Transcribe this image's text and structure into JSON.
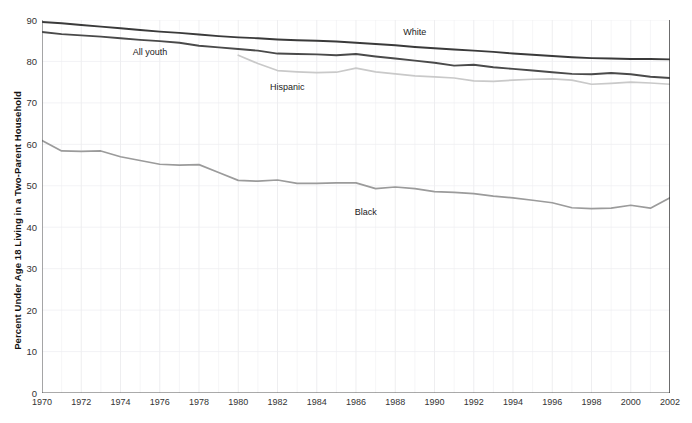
{
  "chart_data": {
    "type": "line",
    "title": "",
    "xlabel": "",
    "ylabel": "Percent Under Age 18 Living in a Two-Parent Household",
    "xlim": [
      1970,
      2002
    ],
    "ylim": [
      0,
      90
    ],
    "ytick_step": 10,
    "yticks": [
      0,
      10,
      20,
      30,
      40,
      50,
      60,
      70,
      80,
      90
    ],
    "xticks": [
      1970,
      1972,
      1974,
      1976,
      1978,
      1980,
      1982,
      1984,
      1986,
      1988,
      1990,
      1992,
      1994,
      1996,
      1998,
      2000,
      2002
    ],
    "grid": true,
    "grid_minor_x": "every year",
    "legend_position": "inline-annotations",
    "x": [
      1970,
      1971,
      1972,
      1973,
      1974,
      1975,
      1976,
      1977,
      1978,
      1979,
      1980,
      1981,
      1982,
      1983,
      1984,
      1985,
      1986,
      1987,
      1988,
      1989,
      1990,
      1991,
      1992,
      1993,
      1994,
      1995,
      1996,
      1997,
      1998,
      1999,
      2000,
      2001,
      2002
    ],
    "series": [
      {
        "name": "White",
        "color": "#3a3a3a",
        "label": "White",
        "label_x": 1989,
        "label_y": 86.5,
        "values": [
          89.5,
          89.2,
          88.8,
          88.4,
          88.0,
          87.6,
          87.2,
          86.9,
          86.5,
          86.1,
          85.8,
          85.6,
          85.3,
          85.1,
          85.0,
          84.8,
          84.5,
          84.2,
          83.9,
          83.5,
          83.2,
          82.9,
          82.6,
          82.3,
          81.9,
          81.6,
          81.3,
          81.0,
          80.8,
          80.7,
          80.6,
          80.6,
          80.5
        ]
      },
      {
        "name": "All youth",
        "color": "#4a4a4a",
        "label": "All youth",
        "label_x": 1975.5,
        "label_y": 81.5,
        "values": [
          87.1,
          86.6,
          86.3,
          86.0,
          85.6,
          85.2,
          84.9,
          84.5,
          83.8,
          83.4,
          83.0,
          82.6,
          81.9,
          81.8,
          81.7,
          81.5,
          81.8,
          81.2,
          80.7,
          80.2,
          79.7,
          79.0,
          79.2,
          78.6,
          78.2,
          77.8,
          77.4,
          77.0,
          76.9,
          77.2,
          76.9,
          76.3,
          76.0
        ]
      },
      {
        "name": "Hispanic",
        "color": "#c9c9c9",
        "label": "Hispanic",
        "label_x": 1982.5,
        "label_y": 73.0,
        "values": [
          null,
          null,
          null,
          null,
          null,
          null,
          null,
          null,
          null,
          null,
          81.5,
          79.5,
          77.8,
          77.5,
          77.3,
          77.4,
          78.4,
          77.5,
          77.0,
          76.5,
          76.3,
          76.0,
          75.3,
          75.2,
          75.5,
          75.7,
          75.8,
          75.5,
          74.5,
          74.7,
          75.0,
          74.8,
          74.5
        ]
      },
      {
        "name": "Black",
        "color": "#9b9b9b",
        "label": "Black",
        "label_x": 1986.5,
        "label_y": 43.0,
        "values": [
          60.9,
          58.4,
          58.3,
          58.4,
          57.0,
          56.1,
          55.2,
          55.0,
          55.1,
          53.2,
          51.3,
          51.1,
          51.4,
          50.6,
          50.6,
          50.7,
          50.7,
          49.3,
          49.7,
          49.3,
          48.6,
          48.4,
          48.1,
          47.5,
          47.1,
          46.5,
          45.9,
          44.7,
          44.5,
          44.6,
          45.3,
          44.6,
          47.1
        ]
      }
    ]
  }
}
